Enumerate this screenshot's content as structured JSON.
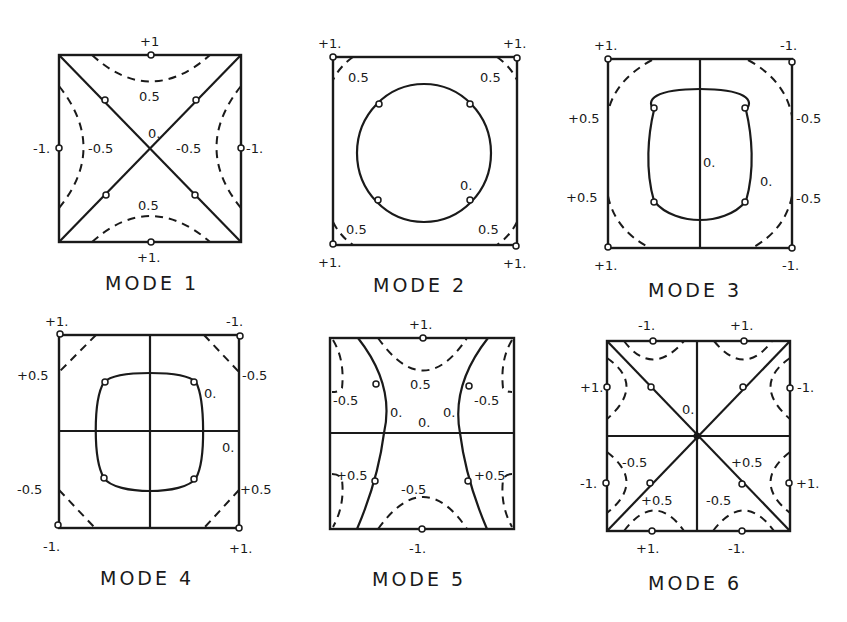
{
  "figure": {
    "line_legend": {
      "solid": "nodal line (0.)",
      "dashed": "contour line (±0.5)",
      "circle": "node marker"
    },
    "modes": [
      {
        "title": "MODE 1",
        "labels": {
          "top": "+1",
          "bottom": "+1.",
          "left": "-1.",
          "right": "-1.",
          "center": "0.",
          "upper": "0.5",
          "lower": "0.5",
          "inner_left": "-0.5",
          "inner_right": "-0.5"
        }
      },
      {
        "title": "MODE 2",
        "labels": {
          "corner_tl": "+1.",
          "corner_tr": "+1.",
          "corner_bl": "+1.",
          "corner_br": "+1.",
          "tl_contour": "0.5",
          "tr_contour": "0.5",
          "bl_contour": "0.5",
          "br_contour": "0.5",
          "circle": "0."
        }
      },
      {
        "title": "MODE 3",
        "labels": {
          "corner_tl": "+1.",
          "corner_tr": "-1.",
          "corner_bl": "+1.",
          "corner_br": "-1.",
          "left_upper": "+0.5",
          "left_lower": "+0.5",
          "right_upper": "-0.5",
          "right_lower": "-0.5",
          "center": "0.",
          "ring": "0."
        }
      },
      {
        "title": "MODE 4",
        "labels": {
          "corner_tl": "+1.",
          "corner_tr": "-1.",
          "corner_bl": "-1.",
          "corner_br": "+1.",
          "left_upper": "+0.5",
          "right_upper": "-0.5",
          "left_lower": "-0.5",
          "right_lower": "+0.5",
          "ring": "0.",
          "axis": "0."
        }
      },
      {
        "title": "MODE 5",
        "labels": {
          "top": "+1.",
          "bottom": "-1.",
          "upper_center": "0.5",
          "lower_center": "-0.5",
          "upper_left": "-0.5",
          "upper_right": "-0.5",
          "lower_left": "+0.5",
          "lower_right": "+0.5",
          "zero_left": "0.",
          "zero_center": "0.",
          "zero_right": "0."
        }
      },
      {
        "title": "MODE 6",
        "labels": {
          "top_left": "-1.",
          "top_right": "+1.",
          "bottom_left": "+1.",
          "bottom_right": "-1.",
          "left_upper": "+1.",
          "left_lower": "-1.",
          "right_upper": "-1.",
          "right_lower": "+1.",
          "center": "0.",
          "ll_a": "-0.5",
          "ll_b": "+0.5",
          "lr_a": "+0.5",
          "lr_b": "-0.5"
        }
      }
    ]
  }
}
